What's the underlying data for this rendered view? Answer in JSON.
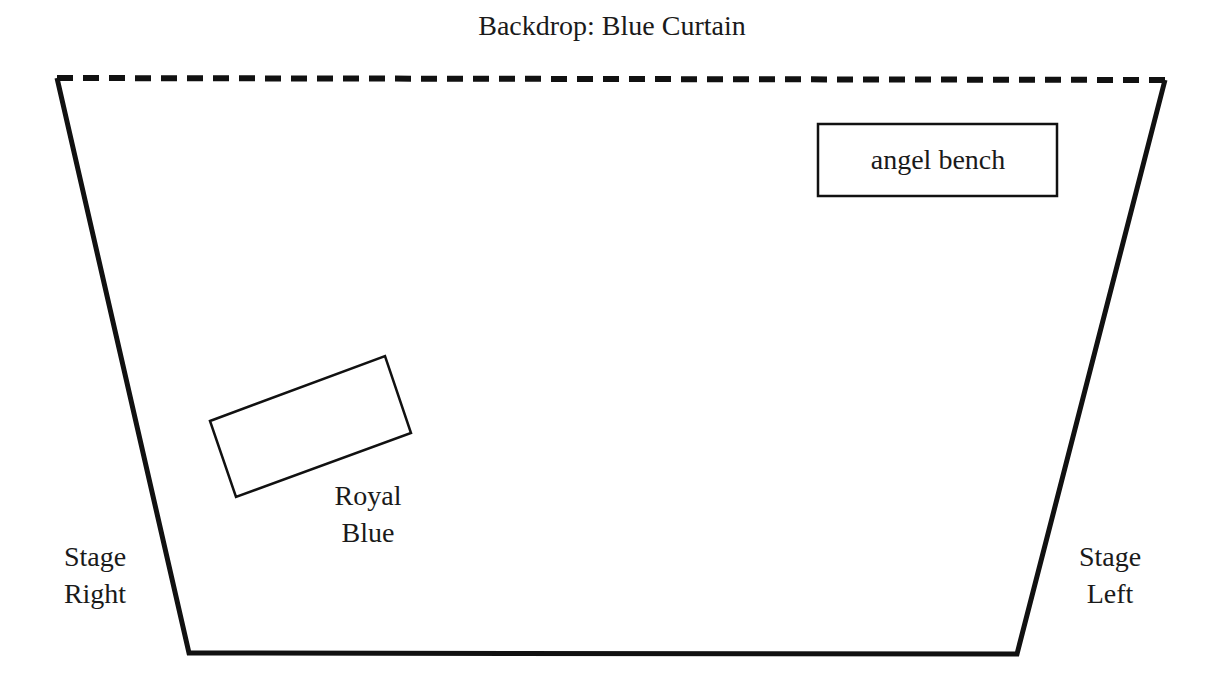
{
  "diagram": {
    "colors": {
      "line": "#111111",
      "background": "#ffffff",
      "text": "#1a1a1a"
    },
    "backdrop": {
      "label": "Backdrop: Blue Curtain",
      "style": "dashed"
    },
    "stage_outline": {
      "shape": "trapezoid",
      "points": [
        [
          57,
          78
        ],
        [
          1165,
          80
        ],
        [
          1017,
          654
        ],
        [
          189,
          653
        ]
      ]
    },
    "props": [
      {
        "id": "angel-bench",
        "label": "angel bench",
        "shape": "rectangle",
        "box": {
          "x": 818,
          "y": 124,
          "width": 239,
          "height": 72
        }
      },
      {
        "id": "royal-blue",
        "label_line1": "Royal",
        "label_line2": "Blue",
        "shape": "rotated-rectangle",
        "points": [
          [
            210,
            421
          ],
          [
            385,
            356
          ],
          [
            411,
            433
          ],
          [
            236,
            497
          ]
        ]
      }
    ],
    "sides": {
      "stage_right": {
        "line1": "Stage",
        "line2": "Right"
      },
      "stage_left": {
        "line1": "Stage",
        "line2": "Left"
      }
    }
  }
}
